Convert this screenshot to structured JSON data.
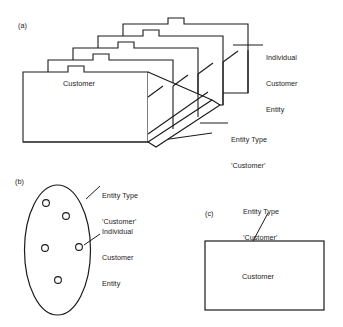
{
  "figure": {
    "background_color": "#ffffff",
    "line_color": "#1a1a1a",
    "panels": [
      {
        "tag": "(a)",
        "representation": "folder-stack",
        "description": "Stack of five tabbed folders sitting in an open tray",
        "front_folder_label": "Customer",
        "annotations": [
          {
            "name": "individual-customer-entity",
            "lines": [
              "Individual",
              "Customer",
              "Entity"
            ],
            "leader": "horizontal-left"
          },
          {
            "name": "entity-type-customer",
            "lines": [
              "Entity Type",
              "'Customer'"
            ],
            "leader": "horizontal-left"
          }
        ]
      },
      {
        "tag": "(b)",
        "representation": "set-ellipse",
        "description": "Ellipse containing five small circles (set members)",
        "member_count": 5,
        "annotations": [
          {
            "name": "entity-type-customer",
            "lines": [
              "Entity Type",
              "'Customer'"
            ],
            "leader": "diagonal-down-left"
          },
          {
            "name": "individual-customer-entity",
            "lines": [
              "Individual",
              "Customer",
              "Entity"
            ],
            "leader": "diagonal-down-left"
          }
        ]
      },
      {
        "tag": "(c)",
        "representation": "entity-rectangle",
        "description": "Plain rectangle naming the entity type",
        "rectangle_label": "Customer",
        "annotations": [
          {
            "name": "entity-type-customer",
            "lines": [
              "Entity Type",
              "'Customer'"
            ],
            "leader": "diagonal-down-right"
          }
        ]
      }
    ]
  },
  "panel_a": {
    "tag": "(a)",
    "front_folder_label": "Customer",
    "annotation_individual": {
      "line1": "Individual",
      "line2": "Customer",
      "line3": "Entity"
    },
    "annotation_entity_type": {
      "line1": "Entity Type",
      "line2": "'Customer'"
    }
  },
  "panel_b": {
    "tag": "(b)",
    "annotation_entity_type": {
      "line1": "Entity Type",
      "line2": "'Customer'"
    },
    "annotation_individual": {
      "line1": "Individual",
      "line2": "Customer",
      "line3": "Entity"
    }
  },
  "panel_c": {
    "tag": "(c)",
    "annotation_entity_type": {
      "line1": "Entity Type",
      "line2": "'Customer'"
    },
    "rectangle_label": "Customer"
  }
}
